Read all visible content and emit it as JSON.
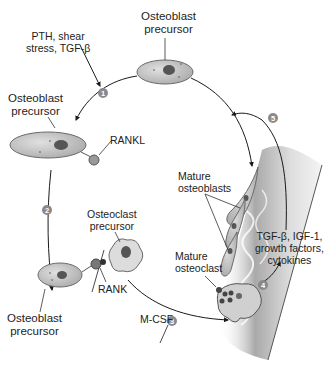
{
  "diagram": {
    "labels": {
      "stimuli": "PTH, shear\nstress, TGF-β",
      "osteoblast_precursor_top": "Osteoblast\nprecursor",
      "osteoblast_precursor_left": "Osteoblast\nprecursor",
      "osteoblast_precursor_bottom": "Osteoblast\nprecursor",
      "rankl": "RANKL",
      "rank": "RANK",
      "osteoclast_precursor": "Osteoclast\nprecursor",
      "mcsf": "M-CSF",
      "mature_osteoclast": "Mature\nosteoclast",
      "mature_osteoblasts": "Mature\nosteoblasts",
      "factors": "TGF-β, IGF-1,\ngrowth factors,\ncytokines"
    },
    "steps": [
      "1",
      "2",
      "3",
      "4",
      "5"
    ],
    "colors": {
      "cell_fill": "#c9c9c9",
      "cell_stroke": "#6a6a6a",
      "nucleus": "#555555",
      "step_badge": "#8a8a8a",
      "bone": "#bdbdbd",
      "arrow": "#1a1a1a"
    }
  }
}
